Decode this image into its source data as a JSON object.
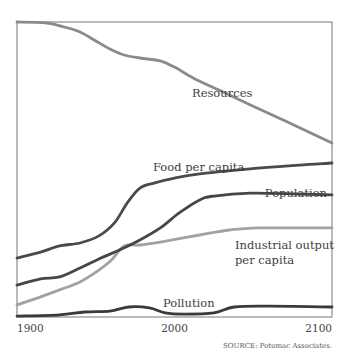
{
  "chart_data": {
    "type": "line",
    "title": "",
    "xlabel": "",
    "ylabel": "",
    "xlim": [
      1900,
      2100
    ],
    "ylim": [
      0,
      1
    ],
    "grid": false,
    "x_ticks": [
      "1900",
      "2000",
      "2100"
    ],
    "source": "SOURCE: Potomac Associates.",
    "series": [
      {
        "name": "Resources",
        "label_lines": [
          "Resources"
        ],
        "color": "#8a8a8a",
        "x": [
          1900,
          1918,
          1930,
          1940,
          1949,
          1959,
          1968,
          1978,
          1991,
          2000,
          2013,
          2032,
          2051,
          2070,
          2100
        ],
        "y": [
          1.0,
          0.997,
          0.983,
          0.966,
          0.939,
          0.908,
          0.888,
          0.878,
          0.868,
          0.847,
          0.807,
          0.76,
          0.712,
          0.665,
          0.59
        ]
      },
      {
        "name": "Food per capita",
        "label_lines": [
          "Food per capita"
        ],
        "color": "#4a4a4a",
        "x": [
          1900,
          1915,
          1927,
          1940,
          1952,
          1962,
          1970,
          1978,
          1987,
          2000,
          2016,
          2048,
          2079,
          2100
        ],
        "y": [
          0.2,
          0.22,
          0.241,
          0.251,
          0.275,
          0.32,
          0.387,
          0.437,
          0.454,
          0.471,
          0.485,
          0.502,
          0.515,
          0.522
        ]
      },
      {
        "name": "Population",
        "label_lines": [
          "Population"
        ],
        "color": "#464646",
        "x": [
          1900,
          1915,
          1927,
          1940,
          1952,
          1965,
          1978,
          1991,
          2003,
          2016,
          2025,
          2048,
          2079,
          2100
        ],
        "y": [
          0.108,
          0.129,
          0.136,
          0.166,
          0.197,
          0.227,
          0.261,
          0.302,
          0.353,
          0.397,
          0.41,
          0.42,
          0.417,
          0.414
        ]
      },
      {
        "name": "Industrial output per capita",
        "label_lines": [
          "Industrial output",
          "per capita"
        ],
        "color": "#a2a2a2",
        "x": [
          1900,
          1915,
          1927,
          1940,
          1952,
          1960,
          1968,
          1978,
          1991,
          2016,
          2035,
          2054,
          2100
        ],
        "y": [
          0.041,
          0.068,
          0.092,
          0.119,
          0.159,
          0.193,
          0.241,
          0.244,
          0.254,
          0.278,
          0.295,
          0.302,
          0.302
        ]
      },
      {
        "name": "Pollution",
        "label_lines": [
          "Pollution"
        ],
        "color": "#3a3a3a",
        "x": [
          1900,
          1927,
          1943,
          1959,
          1971,
          1984,
          1994,
          2006,
          2025,
          2038,
          2060,
          2100
        ],
        "y": [
          0.003,
          0.007,
          0.017,
          0.02,
          0.034,
          0.031,
          0.014,
          0.01,
          0.014,
          0.034,
          0.037,
          0.034
        ]
      }
    ]
  }
}
